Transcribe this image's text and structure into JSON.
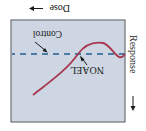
{
  "figure": {
    "orientation": "rotated 180 degrees",
    "x_axis_label": "Dose",
    "y_axis_label": "Response",
    "annotations": {
      "control": "Control",
      "noael": "NOAEL"
    },
    "colors": {
      "plot_background": "#cdd6e2",
      "plot_border": "#6e7074",
      "control_line": "#4a7aa6",
      "curve": "#a8384f",
      "text": "#1a1a1a"
    }
  }
}
